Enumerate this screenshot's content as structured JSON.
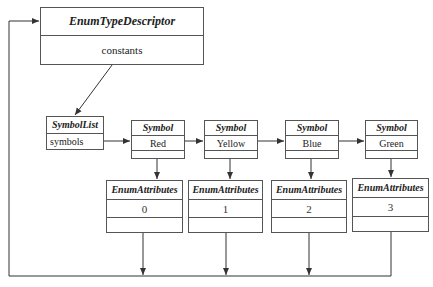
{
  "descriptor": {
    "title": "EnumTypeDescriptor",
    "field": "constants"
  },
  "symbol_list": {
    "title": "SymbolList",
    "field": "symbols"
  },
  "symbols": [
    {
      "title": "Symbol",
      "value": "Red"
    },
    {
      "title": "Symbol",
      "value": "Yellow"
    },
    {
      "title": "Symbol",
      "value": "Blue"
    },
    {
      "title": "Symbol",
      "value": "Green"
    }
  ],
  "attributes": [
    {
      "title": "EnumAttributes",
      "value": "0"
    },
    {
      "title": "EnumAttributes",
      "value": "1"
    },
    {
      "title": "EnumAttributes",
      "value": "2"
    },
    {
      "title": "EnumAttributes",
      "value": "3"
    }
  ],
  "colors": {
    "line": "#333333",
    "border": "#555555",
    "background": "#ffffff"
  }
}
